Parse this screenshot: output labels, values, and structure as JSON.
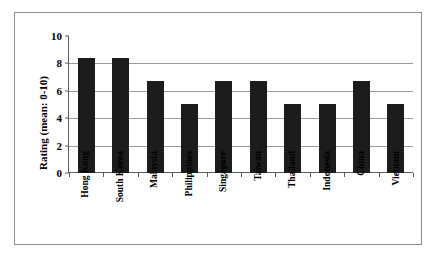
{
  "chart_data": {
    "type": "bar",
    "title": "",
    "xlabel": "",
    "ylabel": "Rating (mean: 0-10)",
    "ylim": [
      0,
      10
    ],
    "yticks": [
      "0",
      "2",
      "4",
      "6",
      "8",
      "10"
    ],
    "grid": true,
    "legend": false,
    "bar_color": "#1c1c1c",
    "categories": [
      "Hong Kong",
      "South Korea",
      "Malaysia",
      "Philippines",
      "Singapore",
      "Taiwan",
      "Thailand",
      "Indonesia",
      "China",
      "Vietnam"
    ],
    "values": [
      8.4,
      8.4,
      6.7,
      5.05,
      6.7,
      6.7,
      5.05,
      5.05,
      6.7,
      5.05
    ]
  }
}
